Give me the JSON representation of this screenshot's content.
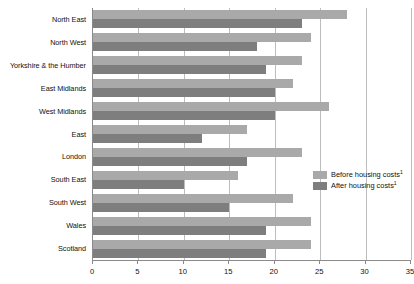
{
  "chart_data": {
    "type": "bar",
    "orientation": "horizontal",
    "title": "",
    "subtitle": "",
    "xlabel": "",
    "ylabel": "",
    "xlim": [
      0,
      35
    ],
    "xticks": [
      0,
      5,
      10,
      15,
      20,
      25,
      30,
      35
    ],
    "xtick_labels": [
      "0",
      "5",
      "10",
      "15",
      "20",
      "25",
      "30",
      "35"
    ],
    "grid": true,
    "grid_axis": "x",
    "legend_position": "right-middle",
    "categories": [
      "North East",
      "North West",
      "Yorkshire & the Humber",
      "East Midlands",
      "West Midlands",
      "East",
      "London",
      "South East",
      "South West",
      "Wales",
      "Scotland"
    ],
    "series": [
      {
        "name": "Before housing costs",
        "footnote_marker": "1",
        "color": "#a9a9a9",
        "values": [
          28,
          24,
          23,
          22,
          26,
          17,
          23,
          16,
          22,
          24,
          24
        ]
      },
      {
        "name": "After housing costs",
        "footnote_marker": "1",
        "color": "#7e7e7e",
        "values": [
          23,
          18,
          19,
          20,
          20,
          12,
          17,
          10,
          15,
          19,
          19
        ]
      }
    ]
  },
  "legend": {
    "items": [
      {
        "label": "Before housing costs",
        "marker": "1",
        "swatch": "before"
      },
      {
        "label": "After housing costs",
        "marker": "1",
        "swatch": "after"
      }
    ]
  },
  "colors": {
    "before_housing_costs": "#a9a9a9",
    "after_housing_costs": "#7e7e7e",
    "gridline": "#bdbdbd",
    "axis": "#8a8a8a",
    "text": "#111111",
    "background": "#ffffff"
  }
}
